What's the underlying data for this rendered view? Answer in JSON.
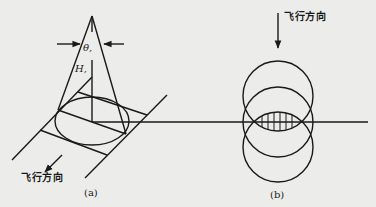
{
  "figure": {
    "panel_a": {
      "caption": "(a)",
      "direction_label": "飞行方向",
      "angle_label": "θ,",
      "height_label": "H,"
    },
    "panel_b": {
      "caption": "(b)",
      "direction_label": "飞行方向"
    }
  },
  "colors": {
    "background": "#ececea",
    "stroke": "#1a1a1a"
  }
}
